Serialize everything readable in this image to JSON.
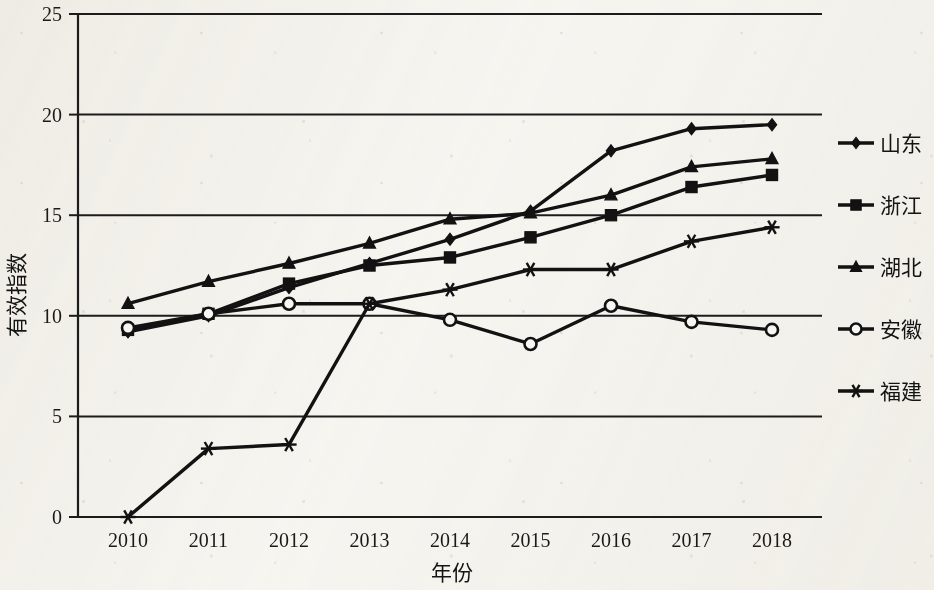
{
  "chart_data": {
    "type": "line",
    "title": "",
    "xlabel": "年份",
    "ylabel": "有效指数",
    "categories": [
      "2010",
      "2011",
      "2012",
      "2013",
      "2014",
      "2015",
      "2016",
      "2017",
      "2018"
    ],
    "x": [
      2010,
      2011,
      2012,
      2013,
      2014,
      2015,
      2016,
      2017,
      2018
    ],
    "xlim": [
      2010,
      2018
    ],
    "ylim": [
      0,
      25
    ],
    "ytick_labels": [
      "0",
      "5",
      "10",
      "15",
      "20",
      "25"
    ],
    "yticks": [
      0,
      5,
      10,
      15,
      20,
      25
    ],
    "grid": "horizontal",
    "legend_position": "right",
    "series": [
      {
        "name": "山东",
        "marker": "diamond",
        "values": [
          9.2,
          10.0,
          11.4,
          12.6,
          13.8,
          15.2,
          18.2,
          19.3,
          19.5
        ]
      },
      {
        "name": "浙江",
        "marker": "square",
        "values": [
          9.3,
          10.1,
          11.6,
          12.5,
          12.9,
          13.9,
          15.0,
          16.4,
          17.0
        ]
      },
      {
        "name": "湖北",
        "marker": "triangle",
        "values": [
          10.6,
          11.7,
          12.6,
          13.6,
          14.8,
          15.1,
          16.0,
          17.4,
          17.8
        ]
      },
      {
        "name": "安徽",
        "marker": "circle-open",
        "values": [
          9.4,
          10.1,
          10.6,
          10.6,
          9.8,
          8.6,
          10.5,
          9.7,
          9.3
        ]
      },
      {
        "name": "福建",
        "marker": "asterisk",
        "values": [
          0.0,
          3.4,
          3.6,
          10.6,
          11.3,
          12.3,
          12.3,
          13.7,
          14.4
        ]
      }
    ]
  },
  "axes": {
    "y_title": "有效指数",
    "x_title": "年份"
  },
  "legend": {
    "entries": [
      {
        "label": "山东",
        "marker": "diamond"
      },
      {
        "label": "浙江",
        "marker": "square"
      },
      {
        "label": "湖北",
        "marker": "triangle"
      },
      {
        "label": "安徽",
        "marker": "circle-open"
      },
      {
        "label": "福建",
        "marker": "asterisk"
      }
    ]
  },
  "colors": {
    "ink": "#121212",
    "paper": "#f7f6f2"
  }
}
